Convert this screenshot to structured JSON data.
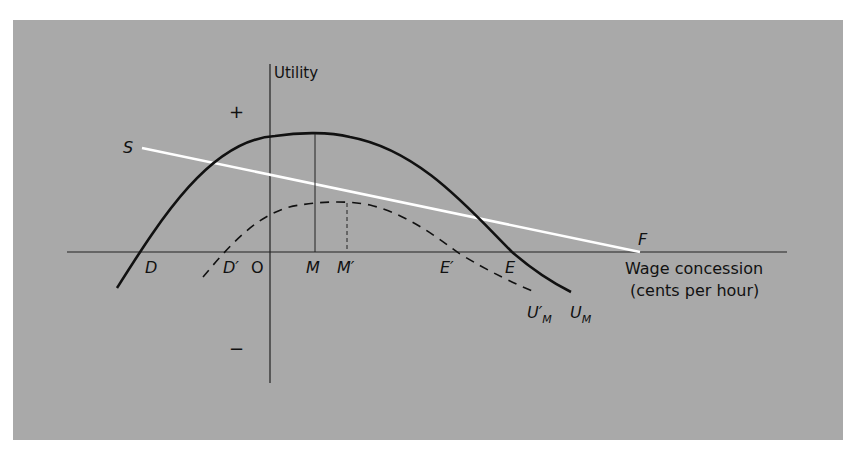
{
  "diagram": {
    "y_axis_label": "Utility",
    "x_axis_label_line1": "Wage concession",
    "x_axis_label_line2": "(cents per hour)",
    "plus_sign": "+",
    "minus_sign": "−",
    "origin_label": "O",
    "points": {
      "D": "D",
      "D_prime": "D′",
      "M": "M",
      "M_prime": "M′",
      "E_prime": "E′",
      "E": "E",
      "S": "S",
      "F": "F"
    },
    "curves": {
      "U_M": {
        "label": "U",
        "subscript": "M",
        "style": "solid"
      },
      "U_M_prime": {
        "label": "U′",
        "subscript": "M",
        "style": "dashed"
      },
      "SF_line": {
        "label": "S–F",
        "style": "white line"
      }
    },
    "colors": {
      "background": "#a9a9a9",
      "curve": "#111111",
      "sf_line": "#ffffff"
    }
  }
}
